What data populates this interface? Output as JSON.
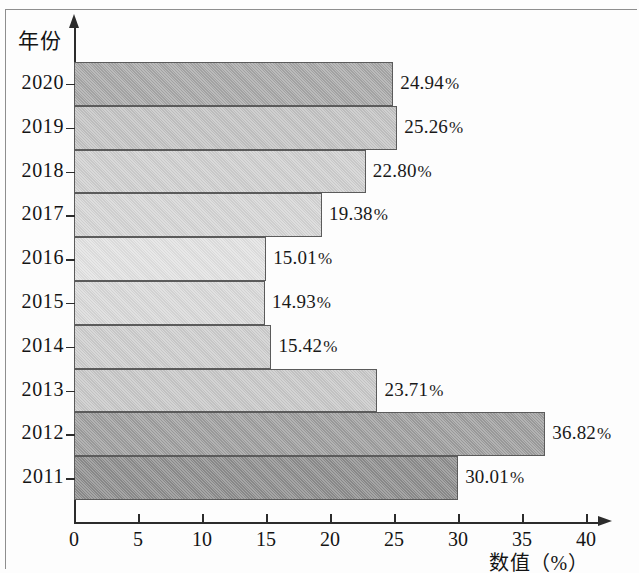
{
  "chart_data": {
    "type": "bar",
    "orientation": "horizontal",
    "title": "",
    "xlabel": "数值（%）",
    "ylabel": "年份",
    "categories": [
      "2020",
      "2019",
      "2018",
      "2017",
      "2016",
      "2015",
      "2014",
      "2013",
      "2012",
      "2011"
    ],
    "values": [
      24.94,
      25.26,
      22.8,
      19.38,
      15.01,
      14.93,
      15.42,
      23.71,
      36.82,
      30.01
    ],
    "value_labels": [
      "24.94%",
      "25.26%",
      "22.80%",
      "19.38%",
      "15.01%",
      "14.93%",
      "15.42%",
      "23.71%",
      "36.82%",
      "30.01%"
    ],
    "bar_colors": [
      "#a8a8a8",
      "#c3c3c3",
      "#cfcfcf",
      "#d5d5d5",
      "#e2e2e2",
      "#d9d9d9",
      "#cdcdcd",
      "#c8c8c8",
      "#9e9e9e",
      "#8d8d8d"
    ],
    "xlim": [
      0,
      43
    ],
    "xticks": [
      0,
      5,
      10,
      15,
      20,
      25,
      30,
      35,
      40
    ],
    "xtick_labels": [
      "0",
      "5",
      "10",
      "15",
      "20",
      "25",
      "30",
      "35",
      "40"
    ],
    "grid": false,
    "legend": false,
    "axis_color": "#2c2c2c",
    "bar_edge_color": "#5b5b5b"
  }
}
